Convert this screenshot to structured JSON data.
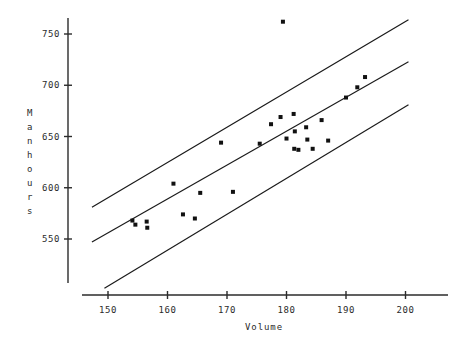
{
  "chart_data": {
    "type": "scatter",
    "title": "",
    "xlabel": "Volume",
    "ylabel": "Manhours",
    "ylabel_letters": [
      "M",
      "a",
      "n",
      "h",
      "o",
      "u",
      "r",
      "s"
    ],
    "xlim": [
      147,
      206
    ],
    "ylim": [
      520,
      768
    ],
    "xticks": [
      150,
      160,
      170,
      180,
      190,
      200
    ],
    "yticks": [
      550,
      600,
      650,
      700,
      750
    ],
    "xtick_labels": [
      "150",
      "160",
      "170",
      "180",
      "190",
      "200"
    ],
    "ytick_labels": [
      "550",
      "600",
      "650",
      "700",
      "750"
    ],
    "grid": false,
    "legend": null,
    "marker": "square",
    "marker_color": "#111111",
    "marker_size_px": 4,
    "line_color": "#1a1a1a",
    "axis_color": "#2b2b2b",
    "points": [
      {
        "x": 154.1,
        "y": 568
      },
      {
        "x": 154.6,
        "y": 564
      },
      {
        "x": 156.5,
        "y": 567
      },
      {
        "x": 156.6,
        "y": 561
      },
      {
        "x": 161.0,
        "y": 604
      },
      {
        "x": 162.6,
        "y": 574
      },
      {
        "x": 164.6,
        "y": 570
      },
      {
        "x": 165.5,
        "y": 595
      },
      {
        "x": 169.0,
        "y": 644
      },
      {
        "x": 171.0,
        "y": 596
      },
      {
        "x": 175.5,
        "y": 643
      },
      {
        "x": 177.4,
        "y": 662
      },
      {
        "x": 179.0,
        "y": 669
      },
      {
        "x": 179.4,
        "y": 762
      },
      {
        "x": 180.0,
        "y": 648
      },
      {
        "x": 181.2,
        "y": 672
      },
      {
        "x": 181.3,
        "y": 638
      },
      {
        "x": 181.4,
        "y": 655
      },
      {
        "x": 182.0,
        "y": 637
      },
      {
        "x": 183.3,
        "y": 659
      },
      {
        "x": 183.5,
        "y": 647
      },
      {
        "x": 184.4,
        "y": 638
      },
      {
        "x": 185.9,
        "y": 666
      },
      {
        "x": 187.0,
        "y": 646
      },
      {
        "x": 190.0,
        "y": 688
      },
      {
        "x": 191.9,
        "y": 698
      },
      {
        "x": 193.2,
        "y": 708
      }
    ],
    "bands": [
      {
        "name": "upper-band-line",
        "x_start": 147.3,
        "y_start": 581,
        "x_end": 200.5,
        "y_end": 764
      },
      {
        "name": "center-fit-line",
        "x_start": 147.3,
        "y_start": 547,
        "x_end": 200.5,
        "y_end": 723
      },
      {
        "name": "lower-band-line",
        "x_start": 149.4,
        "y_start": 502,
        "x_end": 200.5,
        "y_end": 681
      }
    ]
  },
  "axes": {
    "x_axis_name": "volume-axis",
    "y_axis_name": "manhours-axis"
  }
}
